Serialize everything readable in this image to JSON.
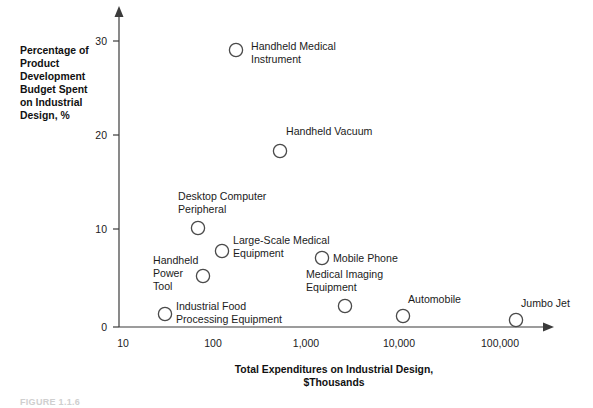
{
  "chart_data": {
    "type": "scatter",
    "title": "",
    "xlabel": "Total Expenditures on Industrial Design, $Thousands",
    "ylabel": "Percentage of Product Development Budget Spent on Industrial Design, %",
    "xscale": "log",
    "yscale": "linear",
    "xlim": [
      10,
      300000
    ],
    "ylim": [
      0,
      32
    ],
    "grid": false,
    "legend": "none",
    "xticks": [
      "10",
      "100",
      "1,000",
      "10,000",
      "100,000"
    ],
    "xtick_values": [
      10,
      100,
      1000,
      10000,
      100000
    ],
    "yticks": [
      "0",
      "10",
      "20",
      "30"
    ],
    "ytick_values": [
      0,
      10,
      20,
      30
    ],
    "points": [
      {
        "label": "Handheld Medical Instrument",
        "x": 200,
        "y": 29.5,
        "px": 236,
        "py": 50,
        "label_x": 251,
        "label_y": 50,
        "label_lines": [
          "Handheld Medical",
          "Instrument"
        ],
        "label_anchor": "start"
      },
      {
        "label": "Handheld Vacuum",
        "x": 700,
        "y": 18.7,
        "px": 280,
        "py": 151,
        "label_x": 286,
        "label_y": 135,
        "label_lines": [
          "Handheld Vacuum"
        ],
        "label_anchor": "start"
      },
      {
        "label": "Desktop Computer Peripheral",
        "x": 70,
        "y": 10.5,
        "px": 198,
        "py": 228,
        "label_x": 178,
        "label_y": 200,
        "label_lines": [
          "Desktop Computer",
          "Peripheral"
        ],
        "label_anchor": "start"
      },
      {
        "label": "Large-Scale Medical Equipment",
        "x": 130,
        "y": 8.0,
        "px": 222,
        "py": 251,
        "label_x": 233,
        "label_y": 244,
        "label_lines": [
          "Large-Scale Medical",
          "Equipment"
        ],
        "label_anchor": "start"
      },
      {
        "label": "Handheld Power Tool",
        "x": 80,
        "y": 5.5,
        "px": 203,
        "py": 276,
        "label_x": 153,
        "label_y": 264,
        "label_lines": [
          "Handheld",
          "Power",
          "Tool"
        ],
        "label_anchor": "start"
      },
      {
        "label": "Mobile Phone",
        "x": 1600,
        "y": 7.3,
        "px": 322,
        "py": 258,
        "label_x": 333,
        "label_y": 262,
        "label_lines": [
          "Mobile Phone"
        ],
        "label_anchor": "start"
      },
      {
        "label": "Medical Imaging Equipment",
        "x": 2600,
        "y": 2.3,
        "px": 345,
        "py": 306,
        "label_x": 306,
        "label_y": 278,
        "label_lines": [
          "Medical Imaging",
          "Equipment"
        ],
        "label_anchor": "start"
      },
      {
        "label": "Industrial Food Processing Equipment",
        "x": 30,
        "y": 1.5,
        "px": 165,
        "py": 314,
        "label_x": 176,
        "label_y": 310,
        "label_lines": [
          "Industrial Food",
          "Processing Equipment"
        ],
        "label_anchor": "start"
      },
      {
        "label": "Automobile",
        "x": 11000,
        "y": 1.2,
        "px": 403,
        "py": 316,
        "label_x": 408,
        "label_y": 303,
        "label_lines": [
          "Automobile"
        ],
        "label_anchor": "start"
      },
      {
        "label": "Jumbo Jet",
        "x": 140000,
        "y": 0.8,
        "px": 516,
        "py": 320,
        "label_x": 521,
        "label_y": 307,
        "label_lines": [
          "Jumbo Jet"
        ],
        "label_anchor": "start"
      }
    ]
  },
  "axes": {
    "y_title_lines": [
      "Percentage of",
      "Product",
      "Development",
      "Budget Spent",
      "on Industrial",
      "Design, %"
    ],
    "x_title_lines": [
      "Total Expenditures on Industrial Design,",
      "$Thousands"
    ]
  },
  "caption": {
    "text": "FIGURE 1.1.6"
  },
  "colors": {
    "axis": "#3b3b3b",
    "marker_stroke": "#4a4a4a",
    "text": "#1b1b1b",
    "background": "#ffffff"
  }
}
